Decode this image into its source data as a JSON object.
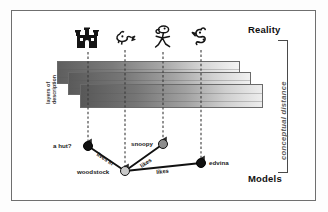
{
  "figure": {
    "top_label": "Reality",
    "bottom_label": "Models",
    "axis_label": "conceptual distance",
    "layers_label_line1": "layers of",
    "layers_label_line2": "description"
  },
  "reality_icons": [
    {
      "name": "castle-doghouse-icon",
      "alt": "castle"
    },
    {
      "name": "small-bird-icon",
      "alt": "bird"
    },
    {
      "name": "dancing-dog-icon",
      "alt": "snoopy dancing"
    },
    {
      "name": "bird-character-icon",
      "alt": "edvina bird"
    }
  ],
  "layers": [
    {
      "id": "layer-back",
      "shade_from": "#5e5e5e",
      "shade_to": "#f2f2f2"
    },
    {
      "id": "layer-middle",
      "shade_from": "#5a5a5a",
      "shade_to": "#efefef"
    },
    {
      "id": "layer-front",
      "shade_from": "#585858",
      "shade_to": "#e9e9e9"
    }
  ],
  "model_nodes": [
    {
      "id": "a-hut",
      "label": "a hut?",
      "style": "dark",
      "label_side": "left"
    },
    {
      "id": "woodstock",
      "label": "woodstock",
      "style": "light",
      "label_side": "left"
    },
    {
      "id": "snoopy",
      "label": "snoopy",
      "style": "mid",
      "label_side": "left"
    },
    {
      "id": "edvina",
      "label": "edvina",
      "style": "dark",
      "label_side": "right"
    }
  ],
  "model_edges": [
    {
      "id": "edge-lives-in",
      "label": "lives in"
    },
    {
      "id": "edge-likes-snoopy",
      "label": "likes"
    },
    {
      "id": "edge-likes-edvina",
      "label": "likes"
    }
  ],
  "colors": {
    "frame": "#6f6f6f",
    "node_dark": "#111111",
    "node_light": "#c9c9c9",
    "axis_text": "#5d5d5d"
  }
}
